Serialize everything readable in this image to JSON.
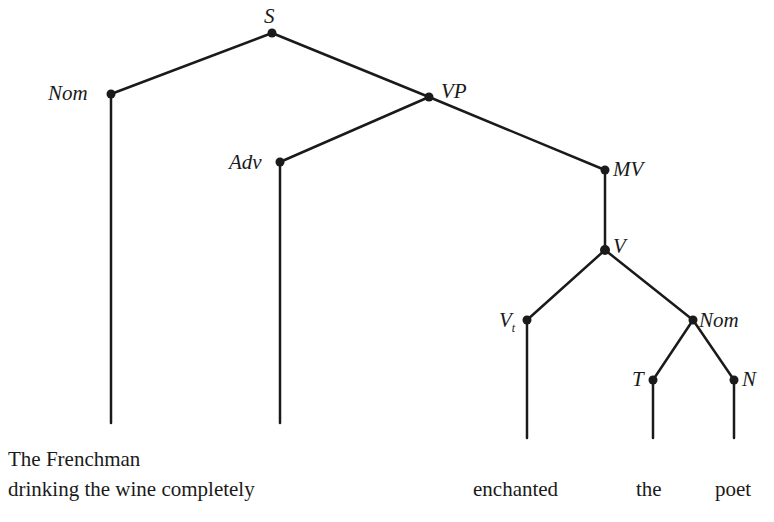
{
  "diagram": {
    "type": "syntax-tree",
    "nodes": {
      "S": "S",
      "Nom": "Nom",
      "VP": "VP",
      "Adv": "Adv",
      "MV": "MV",
      "V": "V",
      "Vt": "V",
      "Vt_sub": "t",
      "Nom2": "Nom",
      "T": "T",
      "N": "N"
    },
    "words": {
      "line1": "The Frenchman",
      "line2": "drinking the wine completely",
      "enchanted": "enchanted",
      "the": "the",
      "poet": "poet"
    },
    "edges": [
      [
        "S",
        "Nom"
      ],
      [
        "S",
        "VP"
      ],
      [
        "VP",
        "Adv"
      ],
      [
        "VP",
        "MV"
      ],
      [
        "MV",
        "V"
      ],
      [
        "V",
        "Vt"
      ],
      [
        "V",
        "Nom2"
      ],
      [
        "Nom2",
        "T"
      ],
      [
        "Nom2",
        "N"
      ]
    ]
  }
}
